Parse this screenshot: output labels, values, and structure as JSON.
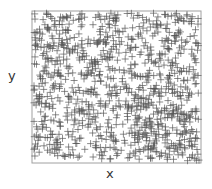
{
  "chart_data": {
    "type": "scatter",
    "title": "",
    "xlabel": "x",
    "ylabel": "y",
    "marker": "+",
    "marker_color": "#555555",
    "frame_color": "#999999",
    "grid": false,
    "ticks": false,
    "legend": null,
    "xlim": [
      0,
      1
    ],
    "ylim": [
      0,
      1
    ],
    "point_count_estimate": 1000,
    "distribution": "uniform random over unit square",
    "seed": 7
  }
}
